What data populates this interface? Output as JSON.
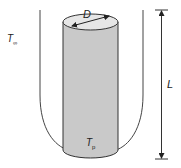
{
  "diagram": {
    "labels": {
      "ambient_temperature": "T",
      "ambient_subscript": "∞",
      "diameter": "D",
      "surface_temperature": "T",
      "surface_subscript": "p",
      "length": "L"
    },
    "colors": {
      "cylinder_fill": "#c9c9c9",
      "cylinder_top": "#e6e6e6",
      "stroke": "#333333",
      "boundary": "#444444"
    }
  }
}
